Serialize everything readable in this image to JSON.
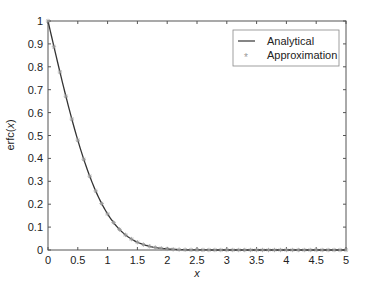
{
  "chart_data": {
    "type": "line",
    "title": "",
    "xlabel": "x",
    "ylabel": "erfc(x)",
    "xlim": [
      0,
      5
    ],
    "ylim": [
      0,
      1
    ],
    "xticks": [
      "0",
      "0.5",
      "1",
      "1.5",
      "2",
      "2.5",
      "3",
      "3.5",
      "4",
      "4.5",
      "5"
    ],
    "yticks": [
      "0",
      "0.1",
      "0.2",
      "0.3",
      "0.4",
      "0.5",
      "0.6",
      "0.7",
      "0.8",
      "0.9",
      "1"
    ],
    "grid": false,
    "legend_position": "upper right",
    "series": [
      {
        "name": "Analytical",
        "style": "line",
        "color": "#333333",
        "function": "erfc(x)",
        "x": [
          0,
          0.1,
          0.2,
          0.3,
          0.4,
          0.5,
          0.6,
          0.7,
          0.8,
          0.9,
          1.0,
          1.1,
          1.2,
          1.3,
          1.4,
          1.5,
          1.6,
          1.7,
          1.8,
          1.9,
          2.0,
          2.5,
          3.0,
          3.5,
          4.0,
          4.5,
          5.0
        ],
        "values": [
          1.0,
          0.8875,
          0.7773,
          0.6714,
          0.5716,
          0.4795,
          0.3961,
          0.3222,
          0.2579,
          0.2031,
          0.1573,
          0.1198,
          0.0897,
          0.066,
          0.0477,
          0.0339,
          0.0237,
          0.0162,
          0.0109,
          0.0072,
          0.0047,
          0.0004,
          0.0,
          0.0,
          0.0,
          0.0,
          0.0
        ]
      },
      {
        "name": "Approximation",
        "style": "markers",
        "marker": "*",
        "color": "#999999",
        "x": [
          0,
          0.1,
          0.2,
          0.3,
          0.4,
          0.5,
          0.6,
          0.7,
          0.8,
          0.9,
          1.0,
          1.1,
          1.2,
          1.3,
          1.4,
          1.5,
          1.6,
          1.7,
          1.8,
          1.9,
          2.0,
          2.1,
          2.2,
          2.3,
          2.4,
          2.5,
          2.6,
          2.7,
          2.8,
          2.9,
          3.0,
          3.1,
          3.2,
          3.3,
          3.4,
          3.5,
          3.6,
          3.7,
          3.8,
          3.9,
          4.0,
          4.1,
          4.2,
          4.3,
          4.4,
          4.5,
          4.6,
          4.7,
          4.8,
          4.9,
          5.0
        ],
        "values": [
          1.0,
          0.8875,
          0.7773,
          0.6714,
          0.5716,
          0.4795,
          0.3961,
          0.3222,
          0.2579,
          0.2031,
          0.1573,
          0.1198,
          0.0897,
          0.066,
          0.0477,
          0.0339,
          0.0237,
          0.0162,
          0.0109,
          0.0072,
          0.0047,
          0.003,
          0.0019,
          0.0011,
          0.0007,
          0.0004,
          0.0002,
          0.0001,
          0.0001,
          0.0,
          0.0,
          0.0,
          0.0,
          0.0,
          0.0,
          0.0,
          0.0,
          0.0,
          0.0,
          0.0,
          0.0,
          0.0,
          0.0,
          0.0,
          0.0,
          0.0,
          0.0,
          0.0,
          0.0,
          0.0,
          0.0
        ]
      }
    ]
  },
  "legend": {
    "items": [
      {
        "label": "Analytical",
        "symbol": "line"
      },
      {
        "label": "Approximation",
        "symbol": "*"
      }
    ]
  },
  "axes": {
    "xlabel": "x",
    "ylabel": "erfc(x)"
  }
}
